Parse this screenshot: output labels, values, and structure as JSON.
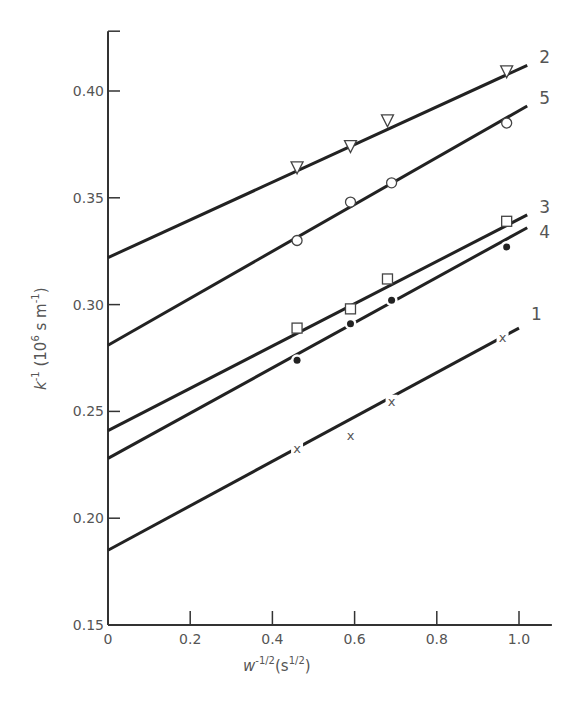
{
  "chart_data": {
    "type": "line",
    "title": "",
    "xlabel": "w^-1/2 (s^1/2)",
    "ylabel": "k^-1 (10^6 s m^-1)",
    "xlim": [
      0,
      1.08
    ],
    "ylim": [
      0.15,
      0.428
    ],
    "grid": false,
    "legend": "inline labels at right end of each line",
    "x_ticks": [
      0,
      0.2,
      0.4,
      0.6,
      0.8,
      1.0
    ],
    "x_tick_labels": [
      "0",
      "0.2",
      "0.4",
      "0.6",
      "0.8",
      "1.0"
    ],
    "y_ticks": [
      0.15,
      0.2,
      0.25,
      0.3,
      0.35,
      0.4
    ],
    "y_tick_labels": [
      "0.15",
      "0.20",
      "0.25",
      "0.30",
      "0.35",
      "0.40"
    ],
    "series": [
      {
        "name": "2",
        "marker": "triangle-down-open",
        "x": [
          0.46,
          0.59,
          0.68,
          0.97
        ],
        "y": [
          0.364,
          0.374,
          0.386,
          0.409
        ],
        "fit": {
          "intercept": 0.322,
          "x_end": 1.02,
          "y_end": 0.412
        }
      },
      {
        "name": "5",
        "marker": "circle-open",
        "x": [
          0.46,
          0.59,
          0.69,
          0.97
        ],
        "y": [
          0.33,
          0.348,
          0.357,
          0.385
        ],
        "fit": {
          "intercept": 0.281,
          "x_end": 1.02,
          "y_end": 0.393
        }
      },
      {
        "name": "3",
        "marker": "square-open",
        "x": [
          0.46,
          0.59,
          0.68,
          0.97
        ],
        "y": [
          0.289,
          0.298,
          0.312,
          0.339
        ],
        "fit": {
          "intercept": 0.241,
          "x_end": 1.02,
          "y_end": 0.342
        }
      },
      {
        "name": "4",
        "marker": "circle-filled",
        "x": [
          0.46,
          0.59,
          0.69,
          0.97
        ],
        "y": [
          0.274,
          0.291,
          0.302,
          0.327
        ],
        "fit": {
          "intercept": 0.228,
          "x_end": 1.02,
          "y_end": 0.336
        }
      },
      {
        "name": "1",
        "marker": "x",
        "x": [
          0.46,
          0.59,
          0.69,
          0.96
        ],
        "y": [
          0.233,
          0.239,
          0.255,
          0.285
        ],
        "fit": {
          "intercept": 0.185,
          "x_end": 1.0,
          "y_end": 0.289
        }
      }
    ]
  },
  "labels": {
    "y_axis": "k",
    "y_axis_sup": "-1",
    "y_axis_units": "(10",
    "y_axis_units_sup": "6",
    "y_axis_units_tail": " s m",
    "y_axis_units_sup2": "-1",
    "y_axis_close": ")",
    "x_axis": "w",
    "x_axis_sup": "-1/2",
    "x_axis_units": "(s",
    "x_axis_units_sup": "1/2",
    "x_axis_close": ")"
  },
  "colors": {
    "line": "#222222",
    "axis": "#333333",
    "text": "#555555"
  }
}
